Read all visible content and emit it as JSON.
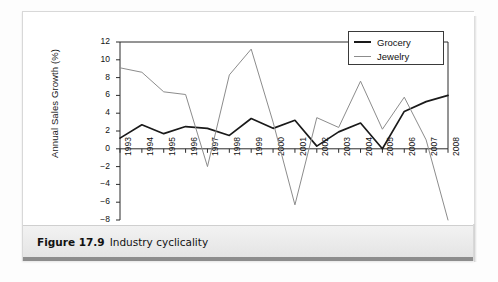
{
  "figure": {
    "caption_number": "Figure 17.9",
    "caption_title": "Industry cyclicality"
  },
  "chart_data": {
    "type": "line",
    "title": "",
    "xlabel": "",
    "ylabel": "Annual Sales Growth (%)",
    "ylim": [
      -8,
      12
    ],
    "yticks": [
      "12",
      "10",
      "8",
      "6",
      "4",
      "2",
      "0",
      "−2",
      "−4",
      "−6",
      "−8"
    ],
    "ytick_values": [
      12,
      10,
      8,
      6,
      4,
      2,
      0,
      -2,
      -4,
      -6,
      -8
    ],
    "grid": false,
    "legend_position": "top-right",
    "categories": [
      "1993",
      "1994",
      "1995",
      "1996",
      "1997",
      "1998",
      "1999",
      "2000",
      "2001",
      "2002",
      "2003",
      "2004",
      "2005",
      "2006",
      "2007",
      "2008"
    ],
    "series": [
      {
        "name": "Grocery",
        "color": "#1a1a1a",
        "values": [
          1.2,
          2.7,
          1.7,
          2.5,
          2.3,
          1.5,
          3.4,
          2.3,
          3.2,
          0.3,
          1.9,
          2.9,
          0.0,
          4.2,
          5.3,
          6.0
        ]
      },
      {
        "name": "Jewelry",
        "color": "#8c8c8c",
        "values": [
          9.1,
          8.6,
          6.4,
          6.1,
          -2.0,
          8.3,
          11.2,
          3.0,
          -6.3,
          3.5,
          2.4,
          7.6,
          2.2,
          5.8,
          1.0,
          -8.0
        ]
      }
    ]
  },
  "legend": {
    "items": [
      {
        "label": "Grocery",
        "color": "#1a1a1a"
      },
      {
        "label": "Jewelry",
        "color": "#8c8c8c"
      }
    ]
  }
}
